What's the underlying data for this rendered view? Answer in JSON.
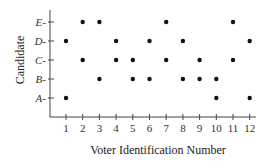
{
  "chart_data": {
    "type": "scatter",
    "title": "",
    "xlabel": "Voter Identification Number",
    "ylabel": "Candidate",
    "x_ticks": [
      "1",
      "2",
      "3",
      "4",
      "5",
      "6",
      "7",
      "8",
      "9",
      "10",
      "11",
      "12"
    ],
    "y_ticks": [
      "A",
      "B",
      "C",
      "D",
      "E"
    ],
    "grid": false,
    "legend": null,
    "points": [
      {
        "x": 1,
        "y": "D"
      },
      {
        "x": 1,
        "y": "A"
      },
      {
        "x": 2,
        "y": "E"
      },
      {
        "x": 2,
        "y": "C"
      },
      {
        "x": 3,
        "y": "E"
      },
      {
        "x": 3,
        "y": "B"
      },
      {
        "x": 4,
        "y": "D"
      },
      {
        "x": 4,
        "y": "C"
      },
      {
        "x": 5,
        "y": "C"
      },
      {
        "x": 5,
        "y": "B"
      },
      {
        "x": 6,
        "y": "D"
      },
      {
        "x": 6,
        "y": "B"
      },
      {
        "x": 7,
        "y": "E"
      },
      {
        "x": 7,
        "y": "C"
      },
      {
        "x": 8,
        "y": "D"
      },
      {
        "x": 8,
        "y": "B"
      },
      {
        "x": 9,
        "y": "C"
      },
      {
        "x": 9,
        "y": "B"
      },
      {
        "x": 10,
        "y": "B"
      },
      {
        "x": 10,
        "y": "A"
      },
      {
        "x": 11,
        "y": "E"
      },
      {
        "x": 11,
        "y": "C"
      },
      {
        "x": 12,
        "y": "D"
      },
      {
        "x": 12,
        "y": "A"
      }
    ]
  },
  "colors": {
    "axis": "#444444",
    "point": "#111111"
  }
}
